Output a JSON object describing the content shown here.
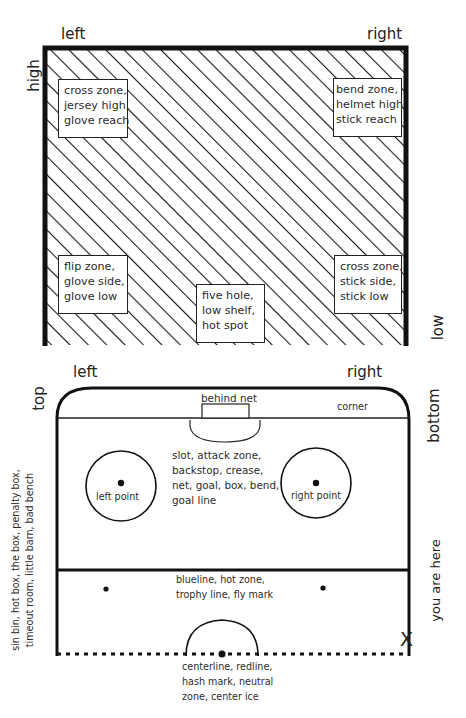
{
  "goal": {
    "labels": {
      "left": "left",
      "right": "right",
      "high": "high",
      "low": "low"
    },
    "zones": [
      {
        "id": "top-left",
        "lines": [
          "cross zone,",
          "jersey high,",
          "glove reach"
        ]
      },
      {
        "id": "top-right",
        "lines": [
          "bend zone,",
          "helmet high",
          "stick reach"
        ]
      },
      {
        "id": "bottom-left",
        "lines": [
          "flip zone,",
          "glove side,",
          "glove low"
        ]
      },
      {
        "id": "bottom-center",
        "lines": [
          "five hole,",
          "low shelf,",
          "hot spot"
        ]
      },
      {
        "id": "bottom-right",
        "lines": [
          "cross zone,",
          "stick side,",
          "stick low"
        ]
      }
    ]
  },
  "rink": {
    "labels": {
      "left": "left",
      "right": "right",
      "top": "top",
      "bottom": "bottom",
      "behind_net": "behind net",
      "corner": "corner",
      "left_point": "left point",
      "right_point": "right point",
      "you_are_here": "you are here",
      "x_mark": "X"
    },
    "slot_lines": [
      "slot, attack zone,",
      "backstop, crease,",
      "net, goal, box, bend,",
      "goal line"
    ],
    "blueline_lines": [
      "blueline, hot zone,",
      "trophy line, fly mark"
    ],
    "centerline_lines": [
      "centerline, redline,",
      "hash mark, neutral",
      "zone, center ice"
    ],
    "penalty_lines": [
      "sin bin, hot box, the box, penalty box,",
      "timeout room, little barn, bad bench"
    ]
  },
  "colors": {
    "ink": "#1a1a1a",
    "paper": "#ffffff"
  }
}
